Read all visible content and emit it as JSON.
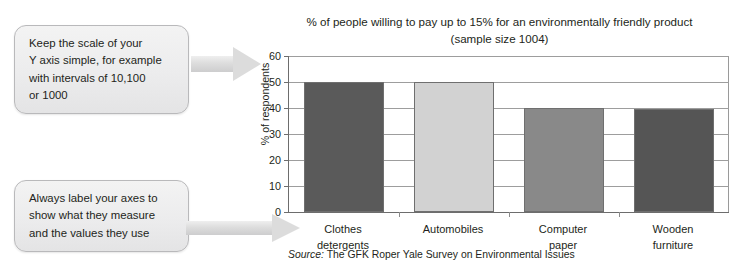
{
  "callouts": {
    "scale_tip": {
      "lines": [
        "Keep the scale of your",
        "Y axis simple, for example",
        "with intervals of 10,100",
        "or 1000"
      ]
    },
    "axes_tip": {
      "lines": [
        "Always label your axes to",
        "show what they measure",
        "and the values they use"
      ]
    }
  },
  "chart_data": {
    "type": "bar",
    "title": "% of people willing to pay up to 15% for an environmentally friendly product (sample size 1004)",
    "title_lines": [
      "% of people willing to pay up to 15% for an environmentally friendly product",
      "(sample size 1004)"
    ],
    "categories": [
      "Clothes detergents",
      "Automobiles",
      "Computer paper",
      "Wooden furniture"
    ],
    "category_lines": [
      [
        "Clothes",
        "detergents"
      ],
      [
        "Automobiles",
        ""
      ],
      [
        "Computer",
        "paper"
      ],
      [
        "Wooden",
        "furniture"
      ]
    ],
    "values": [
      50,
      50,
      40,
      39.5
    ],
    "bar_colors": [
      "#5a5a5a",
      "#d2d2d2",
      "#898989",
      "#555555"
    ],
    "xlabel": "",
    "ylabel": "% of respondents",
    "ylim": [
      0,
      60
    ],
    "yticks": [
      0,
      10,
      20,
      30,
      40,
      50,
      60
    ],
    "ytick_labels": [
      "0",
      "10",
      "20",
      "30",
      "40",
      "50",
      "60"
    ],
    "grid": true,
    "grid_axis": "y",
    "legend": false,
    "source_prefix": "Source:",
    "source_text": "The GFK Roper Yale Survey on Environmental Issues"
  },
  "colors": {
    "page_background": "#ffffff",
    "callout_fill": "#ececed",
    "callout_border": "#b9b9bb",
    "arrow_fill": "#dcdcdc",
    "axis_line": "#6d6d6d",
    "gridline": "#9d9d9d",
    "text": "#231f20"
  }
}
